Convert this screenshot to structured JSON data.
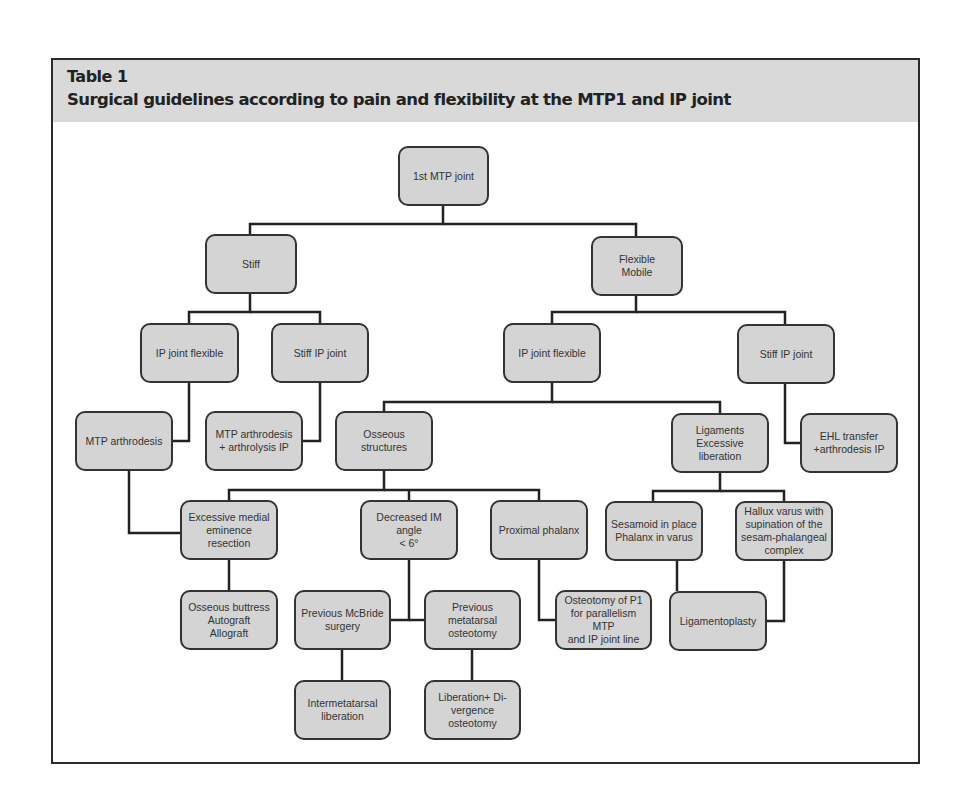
{
  "header": {
    "label": "Table 1",
    "title": "Surgical guidelines according to pain and flexibility at the MTP1 and IP joint",
    "background": "#d9d9d9"
  },
  "colors": {
    "node_fill": "#d4d4d4",
    "node_border": "#333333",
    "connector": "#222222"
  },
  "nodes": {
    "root": "1st MTP joint",
    "stiff": "Stiff",
    "flexible": "Flexible\nMobile",
    "ip_flexible_left": "IP joint flexible",
    "stiff_ip_left": "Stiff IP joint",
    "ip_flexible_right": "IP joint flexible",
    "stiff_ip_right": "Stiff IP joint",
    "mtp_arthrodesis": "MTP arthrodesis",
    "mtp_arthrolysis": "MTP arthrodesis\n+ arthrolysis IP",
    "osseous": "Osseous structures",
    "ligaments": "Ligaments\nExcessive\nliberation",
    "ehl": "EHL transfer\n+arthrodesis IP",
    "medial_eminence": "Excessive medial\neminence\nresection",
    "decreased_im": "Decreased IM\nangle\n< 6°",
    "proximal_phalanx": "Proximal phalanx",
    "sesamoid": "Sesamoid in place\nPhalanx in varus",
    "hallux_varus": "Hallux varus with\nsupination of the\nsesam-phalangeal\ncomplex",
    "buttress": "Osseous buttress\nAutograft\nAllograft",
    "mcbride": "Previous McBride\nsurgery",
    "metatarsal_osteotomy": "Previous\nmetatarsal\nosteotomy",
    "osteotomy_p1": "Osteotomy of P1\nfor parallelism MTP\nand IP joint line",
    "ligamentoplasty": "Ligamentoplasty",
    "intermetatarsal": "Intermetatarsal\nliberation",
    "divergence": "Liberation+ Di-\nvergence\nosteotomy"
  }
}
